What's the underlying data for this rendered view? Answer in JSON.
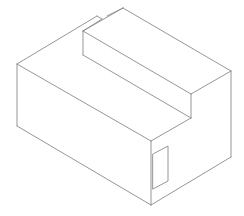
{
  "diagram": {
    "type": "isometric-line-drawing",
    "colors": {
      "background": "#ffffff",
      "stroke": "#8a8a8a"
    },
    "stroke_width": 0.9,
    "edges": [
      {
        "name": "left-vertical-edge",
        "points": "17,64 17,126"
      },
      {
        "name": "bottom-left-edge",
        "points": "17,126 151,205"
      },
      {
        "name": "bottom-right-edge",
        "points": "151,205 231,157"
      },
      {
        "name": "right-vertical-edge",
        "points": "231,157 231,71"
      },
      {
        "name": "front-vertical-edge",
        "points": "151,141 151,205"
      },
      {
        "name": "top-left-front-edge",
        "points": "17,64 151,141"
      },
      {
        "name": "top-right-front-edge",
        "points": "151,141 191,118"
      },
      {
        "name": "left-back-top-edge",
        "points": "17,64 97,16"
      },
      {
        "name": "notch-edge",
        "points": "97,16 102,19"
      },
      {
        "name": "step-back-edge",
        "points": "102,19 83,31"
      },
      {
        "name": "step-top-apex-edge",
        "points": "107,16 123,8"
      },
      {
        "name": "step-top-right-edge",
        "points": "123,8 231,71"
      },
      {
        "name": "step-top-front-edge",
        "points": "231,71 191,94"
      },
      {
        "name": "step-top-left-edge",
        "points": "83,31 191,94"
      },
      {
        "name": "step-left-vertical-edge",
        "points": "83,31 83,55"
      },
      {
        "name": "step-riser-vertical-edge",
        "points": "191,94 191,118"
      },
      {
        "name": "step-floor-edge",
        "points": "83,55 191,118"
      },
      {
        "name": "step-back-to-apex-edge",
        "points": "83,31 123,8"
      }
    ],
    "recess": {
      "name": "front-face-rectangular-recess",
      "points": "153,154 168,146 168,181 153,189"
    }
  }
}
